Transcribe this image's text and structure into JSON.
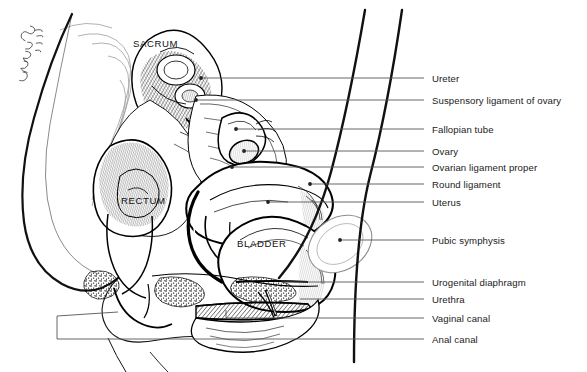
{
  "figure": {
    "style": "pen-and-ink line drawing, black on white",
    "signature": "artist signature (cursive, illegible)"
  },
  "organ_labels": [
    {
      "id": "sacrum",
      "text": "SACRUM",
      "x": 133,
      "y": 46
    },
    {
      "id": "rectum",
      "text": "RECTUM",
      "x": 121,
      "y": 203
    },
    {
      "id": "bladder",
      "text": "BLADDER",
      "x": 237,
      "y": 246
    }
  ],
  "leader_labels": [
    {
      "id": "ureter",
      "text": "Ureter",
      "x": 432,
      "y": 82,
      "line_y": 78,
      "tip_x": 201,
      "tip_y": 78,
      "dot": true
    },
    {
      "id": "suspensory-ligament-ovary",
      "text": "Suspensory ligament of ovary",
      "x": 432,
      "y": 104,
      "line_y": 100,
      "tip_x": 196,
      "tip_y": 100,
      "dot": true
    },
    {
      "id": "fallopian-tube",
      "text": "Fallopian tube",
      "x": 432,
      "y": 133,
      "line_y": 129,
      "tip_x": 236,
      "tip_y": 129,
      "dot": true
    },
    {
      "id": "ovary",
      "text": "Ovary",
      "x": 432,
      "y": 155,
      "line_y": 151,
      "tip_x": 244,
      "tip_y": 151,
      "dot": true
    },
    {
      "id": "ovarian-ligament-proper",
      "text": "Ovarian ligament proper",
      "x": 432,
      "y": 171,
      "line_y": 167,
      "tip_x": 232,
      "tip_y": 167,
      "dot": true
    },
    {
      "id": "round-ligament",
      "text": "Round ligament",
      "x": 432,
      "y": 188,
      "line_y": 184,
      "tip_x": 310,
      "tip_y": 184,
      "dot": true
    },
    {
      "id": "uterus",
      "text": "Uterus",
      "x": 432,
      "y": 206,
      "line_y": 202,
      "tip_x": 268,
      "tip_y": 202,
      "dot": true
    },
    {
      "id": "pubic-symphysis",
      "text": "Pubic symphysis",
      "x": 432,
      "y": 244,
      "line_y": 240,
      "tip_x": 340,
      "tip_y": 240,
      "dot": true
    },
    {
      "id": "urogenital-diaphragm",
      "text": "Urogenital diaphragm",
      "x": 432,
      "y": 286,
      "line_y": 282,
      "tip_x": 282,
      "tip_y": 282,
      "dot": false
    },
    {
      "id": "urethra",
      "text": "Urethra",
      "x": 432,
      "y": 303,
      "line_y": 299,
      "tip_x": 300,
      "tip_y": 299,
      "dot": false
    },
    {
      "id": "vaginal-canal",
      "text": "Vaginal canal",
      "x": 432,
      "y": 322,
      "line_y": 318,
      "tip_x": 226,
      "tip_y": 318,
      "dot": false
    },
    {
      "id": "anal-canal",
      "text": "Anal canal",
      "x": 432,
      "y": 343,
      "line_y": 339,
      "tip_x": 57,
      "tip_y": 339,
      "dot": false
    }
  ],
  "colors": {
    "ink": "#000000",
    "background": "#ffffff",
    "leader_line": "#555555",
    "label_text": "#1b1b1b",
    "faint_contour": "#9a9a9a"
  }
}
